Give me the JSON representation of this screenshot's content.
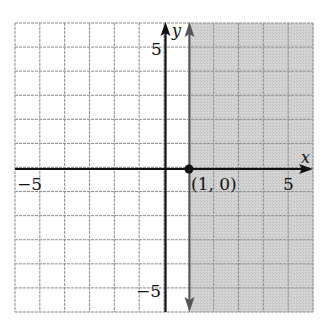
{
  "chart_data": {
    "type": "inequality-graph",
    "title": "",
    "inequality": "x ≥ 1",
    "boundary": {
      "type": "vertical-line",
      "x": 1,
      "style": "solid",
      "arrows": "both"
    },
    "shaded_region": "x ≥ 1 (right of boundary)",
    "highlighted_point": {
      "x": 1,
      "y": 0,
      "label": "(1, 0)"
    },
    "xlabel": "x",
    "ylabel": "y",
    "xlim": [
      -6,
      6
    ],
    "ylim": [
      -6,
      6
    ],
    "grid": true,
    "tick_labels": {
      "x": [
        {
          "value": -5,
          "label": "−5"
        },
        {
          "value": 5,
          "label": "5"
        }
      ],
      "y": [
        {
          "value": 5,
          "label": "5"
        },
        {
          "value": -5,
          "label": "−5"
        }
      ]
    },
    "colors": {
      "shade": "#cfcfcf",
      "grid": "#8a8a8a",
      "axis": "#111111",
      "boundary": "#555555"
    }
  },
  "labels": {
    "x_axis": "x",
    "y_axis": "y",
    "x_neg5": "−5",
    "x_pos5": "5",
    "y_pos5": "5",
    "y_neg5": "−5",
    "point": "(1, 0)"
  }
}
